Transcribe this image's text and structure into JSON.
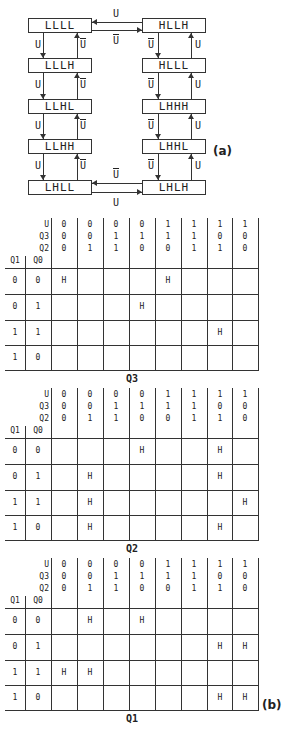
{
  "state_diagram": {
    "label": "(a)",
    "left_column": [
      "LLLL",
      "LLLH",
      "LLHL",
      "LLHH",
      "LHLL"
    ],
    "right_column": [
      "HLLH",
      "HLLL",
      "LHHH",
      "LHHL",
      "LHLH"
    ],
    "edge_labels": {
      "up_count": "U",
      "down_count": "U"
    }
  },
  "kmaps_label": "(b)",
  "kmaps": [
    {
      "title": "Q3",
      "col_headers": {
        "U": [
          "0",
          "0",
          "0",
          "0",
          "1",
          "1",
          "1",
          "1"
        ],
        "Q3": [
          "0",
          "0",
          "1",
          "1",
          "1",
          "1",
          "0",
          "0"
        ],
        "Q2": [
          "0",
          "1",
          "1",
          "0",
          "0",
          "1",
          "1",
          "0"
        ]
      },
      "row_header_labels": [
        "Q1",
        "Q0"
      ],
      "row_labels": [
        [
          "0",
          "0"
        ],
        [
          "0",
          "1"
        ],
        [
          "1",
          "1"
        ],
        [
          "1",
          "0"
        ]
      ],
      "cells": [
        [
          "H",
          "",
          "",
          "",
          "H",
          "",
          "",
          ""
        ],
        [
          "",
          "",
          "",
          "H",
          "",
          "",
          "",
          ""
        ],
        [
          "",
          "",
          "",
          "",
          "",
          "",
          "H",
          ""
        ],
        [
          "",
          "",
          "",
          "",
          "",
          "",
          "",
          ""
        ]
      ]
    },
    {
      "title": "Q2",
      "col_headers": {
        "U": [
          "0",
          "0",
          "0",
          "0",
          "1",
          "1",
          "1",
          "1"
        ],
        "Q3": [
          "0",
          "0",
          "1",
          "1",
          "1",
          "1",
          "0",
          "0"
        ],
        "Q2": [
          "0",
          "1",
          "1",
          "0",
          "0",
          "1",
          "1",
          "0"
        ]
      },
      "row_header_labels": [
        "Q1",
        "Q0"
      ],
      "row_labels": [
        [
          "0",
          "0"
        ],
        [
          "0",
          "1"
        ],
        [
          "1",
          "1"
        ],
        [
          "1",
          "0"
        ]
      ],
      "cells": [
        [
          "",
          "",
          "",
          "H",
          "",
          "",
          "H",
          ""
        ],
        [
          "",
          "H",
          "",
          "",
          "",
          "",
          "H",
          ""
        ],
        [
          "",
          "H",
          "",
          "",
          "",
          "",
          "",
          "H"
        ],
        [
          "",
          "H",
          "",
          "",
          "",
          "",
          "H",
          ""
        ]
      ]
    },
    {
      "title": "Q1",
      "col_headers": {
        "U": [
          "0",
          "0",
          "0",
          "0",
          "1",
          "1",
          "1",
          "1"
        ],
        "Q3": [
          "0",
          "0",
          "1",
          "1",
          "1",
          "1",
          "0",
          "0"
        ],
        "Q2": [
          "0",
          "1",
          "1",
          "0",
          "0",
          "1",
          "1",
          "0"
        ]
      },
      "row_header_labels": [
        "Q1",
        "Q0"
      ],
      "row_labels": [
        [
          "0",
          "0"
        ],
        [
          "0",
          "1"
        ],
        [
          "1",
          "1"
        ],
        [
          "1",
          "0"
        ]
      ],
      "cells": [
        [
          "",
          "H",
          "",
          "H",
          "",
          "",
          "",
          ""
        ],
        [
          "",
          "",
          "",
          "",
          "",
          "",
          "H",
          "H"
        ],
        [
          "H",
          "H",
          "",
          "",
          "",
          "",
          "",
          ""
        ],
        [
          "",
          "",
          "",
          "",
          "",
          "",
          "H",
          "H"
        ]
      ]
    }
  ]
}
